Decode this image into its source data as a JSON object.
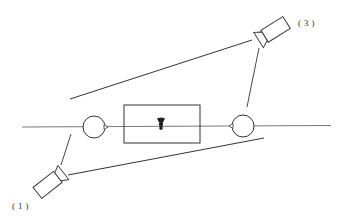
{
  "diagram": {
    "labels": {
      "camera_1": "(1)",
      "camera_3": "(3)"
    },
    "colors": {
      "line": "#333333",
      "background": "#ffffff",
      "marker": "#222222"
    },
    "elements": [
      {
        "type": "axis-line",
        "description": "horizontal baseline through both circles and the rectangle"
      },
      {
        "type": "circle",
        "description": "left node with arrow tip pointing right"
      },
      {
        "type": "rectangle",
        "description": "central box containing a dark marker"
      },
      {
        "type": "circle",
        "description": "right node with arrow tip pointing left"
      },
      {
        "type": "camera",
        "label": "(1)",
        "position": "bottom-left"
      },
      {
        "type": "camera",
        "label": "(3)",
        "position": "top-right"
      },
      {
        "type": "line",
        "description": "sight line from camera (3) to upper-left"
      },
      {
        "type": "line",
        "description": "sight line from camera (1) to lower-right"
      }
    ]
  }
}
